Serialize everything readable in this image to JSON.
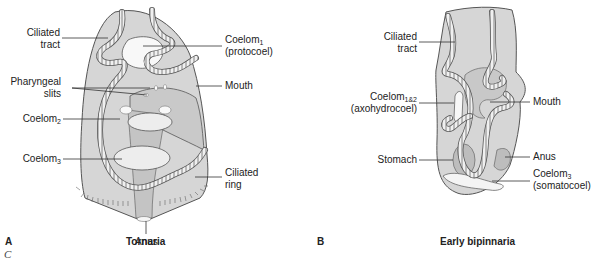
{
  "figure_a": {
    "panel_letter": "A",
    "title": "Tornaria",
    "labels": {
      "ciliated_tract_1": "Ciliated",
      "ciliated_tract_2": "tract",
      "coelom1_main": "Coelom",
      "coelom1_sub": "1",
      "coelom1_note": "(protocoel)",
      "pharyngeal_1": "Pharyngeal",
      "pharyngeal_2": "slits",
      "mouth": "Mouth",
      "coelom2_main": "Coelom",
      "coelom2_sub": "2",
      "coelom3_main": "Coelom",
      "coelom3_sub": "3",
      "ciliated_ring_1": "Ciliated",
      "ciliated_ring_2": "ring",
      "anus": "Anus"
    }
  },
  "figure_b": {
    "panel_letter": "B",
    "title": "Early bipinnaria",
    "labels": {
      "ciliated_tract_1": "Ciliated",
      "ciliated_tract_2": "tract",
      "coelom12_main": "Coelom",
      "coelom12_sub": "1&2",
      "coelom12_note": "(axohydrocoel)",
      "mouth": "Mouth",
      "stomach": "Stomach",
      "anus": "Anus",
      "coelom3_main": "Coelom",
      "coelom3_sub": "3",
      "coelom3_note": "(somatocoel)"
    }
  },
  "caption_fragment": "C",
  "colors": {
    "body_fill": "#d4d4d4",
    "body_stroke": "#555555",
    "tract_fill": "#f0f0f0",
    "tract_stroke": "#555555",
    "cavity_fill": "#f7f7f7",
    "leader": "#333333"
  }
}
